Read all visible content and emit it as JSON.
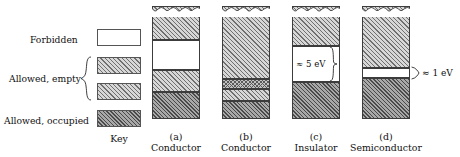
{
  "figure": {
    "key_title": "Key",
    "legend": [
      {
        "label": "Forbidden",
        "swatch": "forbidden"
      },
      {
        "label": "Allowed, empty",
        "swatch": "empty"
      },
      {
        "label": "Allowed, occupied",
        "swatch": "occupied"
      }
    ],
    "columns": [
      {
        "tag": "(a)",
        "name": "Conductor",
        "bands": [
          {
            "kind": "empty",
            "top": 6,
            "height": 34
          },
          {
            "kind": "forbidden",
            "top": 40,
            "height": 30
          },
          {
            "kind": "empty",
            "top": 70,
            "height": 22
          },
          {
            "kind": "occupied",
            "top": 92,
            "height": 27
          }
        ],
        "annotation": null
      },
      {
        "tag": "(b)",
        "name": "Conductor",
        "bands": [
          {
            "kind": "empty",
            "top": 6,
            "height": 73
          },
          {
            "kind": "cross",
            "top": 79,
            "height": 10
          },
          {
            "kind": "empty",
            "top": 89,
            "height": 12
          },
          {
            "kind": "occupied",
            "top": 101,
            "height": 18
          }
        ],
        "annotation": null
      },
      {
        "tag": "(c)",
        "name": "Insulator",
        "bands": [
          {
            "kind": "empty",
            "top": 6,
            "height": 40
          },
          {
            "kind": "forbidden",
            "top": 46,
            "height": 36
          },
          {
            "kind": "occupied",
            "top": 82,
            "height": 37
          }
        ],
        "annotation": {
          "text": "≈ 5 eV",
          "placement": "inside-left",
          "gap_index": 1
        }
      },
      {
        "tag": "(d)",
        "name": "Semiconductor",
        "bands": [
          {
            "kind": "empty",
            "top": 6,
            "height": 62
          },
          {
            "kind": "forbidden",
            "top": 68,
            "height": 10
          },
          {
            "kind": "occupied",
            "top": 78,
            "height": 41
          }
        ],
        "annotation": {
          "text": "≈ 1 eV",
          "placement": "outside-right",
          "gap_index": 1
        }
      }
    ]
  },
  "chart_data": {
    "type": "diagram",
    "xlabel": "",
    "ylabel": "Energy",
    "legend_position": "left",
    "categories": [
      "(a) Conductor",
      "(b) Conductor",
      "(c) Insulator",
      "(d) Semiconductor"
    ],
    "band_gaps_eV": [
      null,
      null,
      5,
      1
    ],
    "annotations": [
      "≈ 5 eV",
      "≈ 1 eV"
    ],
    "series": [
      {
        "name": "(a) Conductor",
        "bands": [
          "allowed empty",
          "forbidden",
          "allowed empty",
          "allowed occupied"
        ]
      },
      {
        "name": "(b) Conductor",
        "bands": [
          "allowed empty",
          "partially occupied (overlap)",
          "allowed empty",
          "allowed occupied"
        ]
      },
      {
        "name": "(c) Insulator",
        "bands": [
          "allowed empty",
          "forbidden (≈ 5 eV)",
          "allowed occupied"
        ]
      },
      {
        "name": "(d) Semiconductor",
        "bands": [
          "allowed empty",
          "forbidden (≈ 1 eV)",
          "allowed occupied"
        ]
      }
    ]
  }
}
